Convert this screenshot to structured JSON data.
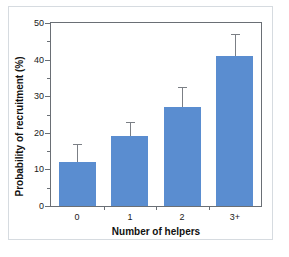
{
  "chart_data": {
    "type": "bar",
    "title": "",
    "xlabel": "Number of helpers",
    "ylabel": "Probability of recruitment (%)",
    "categories": [
      "0",
      "1",
      "2",
      "3+"
    ],
    "values": [
      12,
      19,
      27,
      41
    ],
    "error_upper": [
      17,
      23,
      32.5,
      47
    ],
    "ylim": [
      0,
      50
    ],
    "yticks": [
      0,
      10,
      20,
      30,
      40,
      50
    ],
    "ytick_labels": [
      "0",
      "10",
      "20",
      "30",
      "40",
      "50"
    ],
    "yminor_ticks": [
      5,
      15,
      25,
      35,
      45
    ],
    "grid": false,
    "legend": "none",
    "bar_color": "#5a8dd0",
    "error_bar_color": "#7b7f85",
    "axis_color": "#6a6f75",
    "frame_color": "#d6dbe0",
    "background": "#ffffff"
  }
}
